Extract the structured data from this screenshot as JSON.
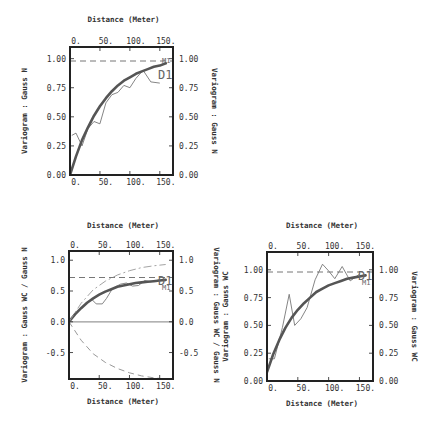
{
  "chart_data": [
    {
      "type": "line",
      "id": "gauss-n",
      "title": "",
      "xlabel_top": "Distance (Meter)",
      "xlabel_bottom": "",
      "ylabel_left": "Variogram : Gauss N",
      "ylabel_right": "Variogram : Gauss N",
      "xlim": [
        0,
        172
      ],
      "ylim": [
        0,
        1.1
      ],
      "x_ticks": [
        "0.",
        "50.",
        "100.",
        "150."
      ],
      "x_tick_values": [
        0,
        50,
        100,
        150
      ],
      "y_ticks": [
        "0.00",
        "0.25",
        "0.50",
        "0.75",
        "1.00"
      ],
      "y_tick_values": [
        0,
        0.25,
        0.5,
        0.75,
        1.0
      ],
      "grid": false,
      "labels": [
        "D1",
        "M1"
      ],
      "series": [
        {
          "name": "Experimental variogram D1",
          "style": "thin",
          "x": [
            3,
            10,
            20,
            30,
            40,
            50,
            60,
            70,
            80,
            90,
            100,
            110,
            122,
            135,
            150
          ],
          "y": [
            0.34,
            0.36,
            0.25,
            0.4,
            0.46,
            0.44,
            0.62,
            0.69,
            0.71,
            0.77,
            0.75,
            0.83,
            0.9,
            0.8,
            0.79
          ]
        },
        {
          "name": "Model M1",
          "style": "thick",
          "x": [
            0,
            10,
            20,
            30,
            40,
            50,
            60,
            70,
            80,
            90,
            100,
            110,
            120,
            130,
            140,
            150,
            160
          ],
          "y": [
            0.0,
            0.16,
            0.3,
            0.41,
            0.51,
            0.59,
            0.66,
            0.72,
            0.77,
            0.81,
            0.84,
            0.87,
            0.89,
            0.91,
            0.93,
            0.94,
            0.96
          ]
        },
        {
          "name": "Sill",
          "style": "dashed",
          "x": [
            0,
            172
          ],
          "y": [
            0.98,
            0.98
          ]
        }
      ]
    },
    {
      "type": "line",
      "id": "gauss-wc-n",
      "title": "",
      "xlabel_top": "Distance (Meter)",
      "xlabel_bottom": "Distance (Meter)",
      "ylabel_left": "Variogram : Gauss WC / Gauss N",
      "ylabel_right": "Variogram : Gauss WC / Gauss N",
      "xlim": [
        0,
        172
      ],
      "ylim": [
        -0.93,
        1.15
      ],
      "x_ticks": [
        "0.",
        "50.",
        "100.",
        "150."
      ],
      "x_tick_values": [
        0,
        50,
        100,
        150
      ],
      "y_ticks": [
        "-0.5",
        "0.0",
        "0.5",
        "1.0"
      ],
      "y_tick_values": [
        -0.5,
        0.0,
        0.5,
        1.0
      ],
      "grid": false,
      "labels": [
        "D1",
        "M1"
      ],
      "series": [
        {
          "name": "Experimental cross-variogram D1",
          "style": "thin",
          "x": [
            3,
            15,
            28,
            38,
            45,
            55,
            62,
            72,
            85,
            95,
            105,
            115,
            125,
            135,
            150
          ],
          "y": [
            0.06,
            0.18,
            0.3,
            0.36,
            0.29,
            0.29,
            0.38,
            0.54,
            0.61,
            0.63,
            0.58,
            0.59,
            0.67,
            0.65,
            0.68
          ]
        },
        {
          "name": "Model M1",
          "style": "thick",
          "x": [
            0,
            10,
            20,
            30,
            40,
            50,
            60,
            70,
            80,
            90,
            100,
            110,
            120,
            130,
            140,
            150,
            160
          ],
          "y": [
            0.0,
            0.12,
            0.22,
            0.31,
            0.38,
            0.44,
            0.49,
            0.53,
            0.57,
            0.59,
            0.61,
            0.63,
            0.64,
            0.65,
            0.66,
            0.67,
            0.68
          ]
        },
        {
          "name": "Sill",
          "style": "dashed",
          "x": [
            0,
            172
          ],
          "y": [
            0.72,
            0.72
          ]
        },
        {
          "name": "Upper envelope",
          "style": "dash-dot",
          "x": [
            0,
            20,
            40,
            60,
            80,
            100,
            120,
            140,
            160
          ],
          "y": [
            0.0,
            0.3,
            0.52,
            0.66,
            0.76,
            0.83,
            0.88,
            0.91,
            0.93
          ]
        },
        {
          "name": "Lower envelope",
          "style": "dashed",
          "x": [
            0,
            20,
            40,
            60,
            80,
            100,
            120,
            140,
            160
          ],
          "y": [
            0.0,
            -0.3,
            -0.52,
            -0.66,
            -0.76,
            -0.83,
            -0.88,
            -0.91,
            -0.93
          ]
        },
        {
          "name": "Zero line",
          "style": "solid-grey",
          "x": [
            0,
            172
          ],
          "y": [
            0.0,
            0.0
          ]
        }
      ]
    },
    {
      "type": "line",
      "id": "gauss-wc",
      "title": "",
      "xlabel_top": "Distance (Meter)",
      "xlabel_bottom": "Distance (Meter)",
      "ylabel_left": "Variogram : Gauss WC",
      "ylabel_right": "Variogram : Gauss WC",
      "xlim": [
        0,
        172
      ],
      "ylim": [
        0,
        1.16
      ],
      "x_ticks": [
        "0.",
        "50.",
        "100.",
        "150."
      ],
      "x_tick_values": [
        0,
        50,
        100,
        150
      ],
      "y_ticks": [
        "0.00",
        "0.25",
        "0.50",
        "0.75",
        "1.00"
      ],
      "y_tick_values": [
        0,
        0.25,
        0.5,
        0.75,
        1.0
      ],
      "grid": false,
      "labels": [
        "D1",
        "M1"
      ],
      "series": [
        {
          "name": "Experimental variogram D1",
          "style": "thin",
          "x": [
            3,
            12,
            25,
            36,
            45,
            55,
            65,
            78,
            90,
            100,
            110,
            122,
            135,
            150
          ],
          "y": [
            0.2,
            0.2,
            0.48,
            0.78,
            0.5,
            0.56,
            0.66,
            0.91,
            1.05,
            0.99,
            0.92,
            1.03,
            0.9,
            0.96
          ]
        },
        {
          "name": "Model M1",
          "style": "thick",
          "x": [
            0,
            10,
            20,
            30,
            40,
            50,
            60,
            70,
            80,
            90,
            100,
            110,
            120,
            130,
            140,
            150,
            160
          ],
          "y": [
            0.08,
            0.24,
            0.37,
            0.48,
            0.57,
            0.64,
            0.7,
            0.75,
            0.8,
            0.83,
            0.86,
            0.88,
            0.9,
            0.92,
            0.93,
            0.94,
            0.95
          ]
        },
        {
          "name": "Sill",
          "style": "dashed",
          "x": [
            0,
            172
          ],
          "y": [
            0.98,
            0.98
          ]
        }
      ]
    }
  ],
  "colors": {
    "frame": "#222222",
    "model": "#555555",
    "experimental": "#777777",
    "sill": "#777777",
    "envelope": "#999999",
    "text": "#333333"
  },
  "layout": {
    "panels": [
      {
        "box": [
          70,
          47,
          173,
          175
        ],
        "top_title_y": 22,
        "bottom_title_y": null,
        "left_title_x": 27,
        "right_title_x": 212
      },
      {
        "box": [
          69,
          251,
          173,
          379
        ],
        "top_title_y": 228,
        "bottom_title_y": 404,
        "left_title_x": 27,
        "right_title_x": 214
      },
      {
        "box": [
          267,
          252,
          373,
          381
        ],
        "top_title_y": 228,
        "bottom_title_y": 406,
        "left_title_x": 228,
        "right_title_x": 412
      }
    ],
    "extra_left_title_panel3": {
      "text": "Variogram : Gauss WC / Gauss N",
      "x": 216
    }
  }
}
